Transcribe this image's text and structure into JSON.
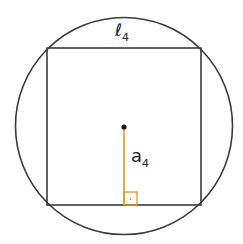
{
  "diagram": {
    "side_label": "ℓ",
    "side_subscript": "4",
    "apothem_label": "a",
    "apothem_subscript": "4",
    "colors": {
      "outline": "#3a3a3a",
      "apothem": "#e8961e",
      "center_dot": "#1a1a1a",
      "background": "#ffffff"
    }
  }
}
